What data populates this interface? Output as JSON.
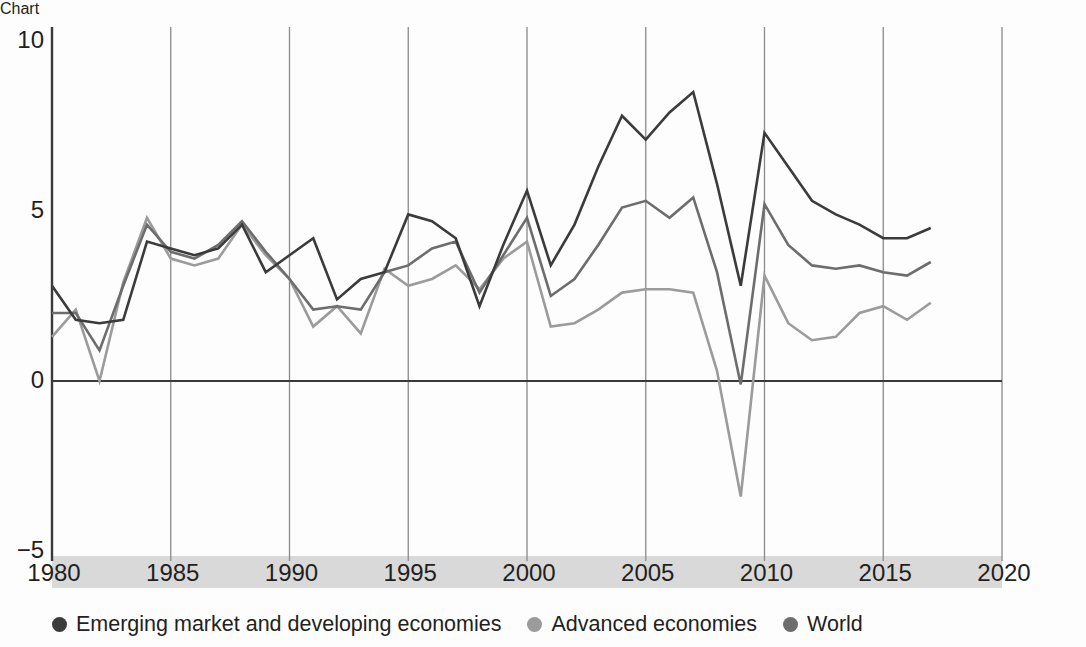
{
  "chart_data": {
    "type": "line",
    "title": "",
    "xlabel": "",
    "ylabel": "",
    "xlim": [
      1980,
      2020
    ],
    "ylim": [
      -5,
      10
    ],
    "grid": "vertical-every-5-years",
    "legend_position": "bottom",
    "x": [
      1980,
      1981,
      1982,
      1983,
      1984,
      1985,
      1986,
      1987,
      1988,
      1989,
      1990,
      1991,
      1992,
      1993,
      1994,
      1995,
      1996,
      1997,
      1998,
      1999,
      2000,
      2001,
      2002,
      2003,
      2004,
      2005,
      2006,
      2007,
      2008,
      2009,
      2010,
      2011,
      2012,
      2013,
      2014,
      2015,
      2016,
      2017
    ],
    "xticks": [
      1980,
      1985,
      1990,
      1995,
      2000,
      2005,
      2010,
      2015,
      2020
    ],
    "yticks": [
      10,
      5,
      0,
      -5
    ],
    "ytick_labels": [
      "10",
      "5",
      "0",
      "−5"
    ],
    "series": [
      {
        "name": "Emerging market and developing economies",
        "color": "#3b3b3b",
        "values": [
          2.8,
          1.8,
          1.7,
          1.8,
          4.1,
          3.9,
          3.7,
          3.9,
          4.6,
          3.2,
          3.7,
          4.2,
          2.4,
          3.0,
          3.2,
          4.9,
          4.7,
          4.2,
          2.2,
          4.0,
          5.6,
          3.4,
          4.6,
          6.3,
          7.8,
          7.1,
          7.9,
          8.5,
          5.8,
          2.8,
          7.3,
          6.3,
          5.3,
          4.9,
          4.6,
          4.2,
          4.2,
          4.5
        ]
      },
      {
        "name": "World",
        "color": "#6d6d6d",
        "values": [
          2.0,
          2.0,
          0.9,
          2.8,
          4.6,
          3.8,
          3.6,
          4.0,
          4.7,
          3.8,
          3.0,
          2.1,
          2.2,
          2.1,
          3.2,
          3.4,
          3.9,
          4.1,
          2.6,
          3.7,
          4.8,
          2.5,
          3.0,
          4.0,
          5.1,
          5.3,
          4.8,
          5.4,
          3.2,
          -0.1,
          5.2,
          4.0,
          3.4,
          3.3,
          3.4,
          3.2,
          3.1,
          3.5
        ]
      },
      {
        "name": "Advanced economies",
        "color": "#9b9b9b",
        "values": [
          1.3,
          2.1,
          0.0,
          2.9,
          4.8,
          3.6,
          3.4,
          3.6,
          4.6,
          3.7,
          3.0,
          1.6,
          2.2,
          1.4,
          3.3,
          2.8,
          3.0,
          3.4,
          2.7,
          3.6,
          4.1,
          1.6,
          1.7,
          2.1,
          2.6,
          2.7,
          2.7,
          2.6,
          0.3,
          -3.4,
          3.1,
          1.7,
          1.2,
          1.3,
          2.0,
          2.2,
          1.8,
          2.3
        ]
      }
    ]
  },
  "legend": {
    "items": [
      {
        "label": "Emerging market and developing economies",
        "color": "#3b3b3b"
      },
      {
        "label": "Advanced economies",
        "color": "#9b9b9b"
      },
      {
        "label": "World",
        "color": "#6d6d6d"
      }
    ]
  },
  "axis": {
    "x_tick_labels": [
      "1980",
      "1985",
      "1990",
      "1995",
      "2000",
      "2005",
      "2010",
      "2015",
      "2020"
    ],
    "y_tick_labels": [
      "10",
      "5",
      "0",
      "−5"
    ]
  },
  "colors": {
    "tick_band": "#d9d9d9",
    "axis_line": "#3a3a3a",
    "gridline": "#8a8a8a",
    "background": "#fdfdfd"
  }
}
